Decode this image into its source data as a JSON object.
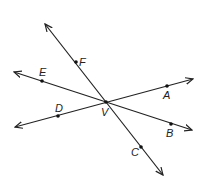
{
  "diagram": {
    "vertex": {
      "name": "V",
      "x": 106,
      "y": 102,
      "label_x": 101,
      "label_y": 116
    },
    "lines": [
      {
        "id": "line-FC",
        "x1": 45,
        "y1": 24,
        "x2": 163,
        "y2": 175
      },
      {
        "id": "line-EB",
        "x1": 14,
        "y1": 72,
        "x2": 192,
        "y2": 130
      },
      {
        "id": "line-DA",
        "x1": 15,
        "y1": 127,
        "x2": 193,
        "y2": 79
      }
    ],
    "points": [
      {
        "name": "F",
        "x": 76,
        "y": 62,
        "label_x": 79,
        "label_y": 66
      },
      {
        "name": "E",
        "x": 42,
        "y": 81,
        "label_x": 39,
        "label_y": 76
      },
      {
        "name": "A",
        "x": 167,
        "y": 86,
        "label_x": 163,
        "label_y": 99
      },
      {
        "name": "D",
        "x": 58,
        "y": 116,
        "label_x": 55,
        "label_y": 112
      },
      {
        "name": "B",
        "x": 171,
        "y": 124,
        "label_x": 166,
        "label_y": 137
      },
      {
        "name": "C",
        "x": 141,
        "y": 147,
        "label_x": 131,
        "label_y": 156
      }
    ],
    "colors": {
      "line": "#222222",
      "background": "#ffffff"
    }
  }
}
